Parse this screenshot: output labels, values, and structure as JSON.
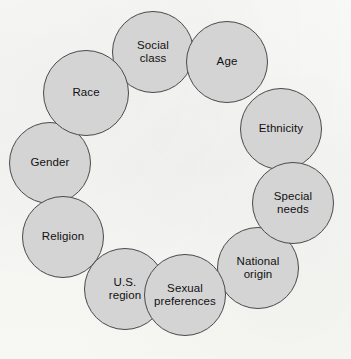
{
  "diagram": {
    "type": "circular-cluster",
    "title": "",
    "geometry": {
      "canvas_width": 351,
      "canvas_height": 359,
      "ring_center_x": 171,
      "ring_center_y": 172,
      "ring_radius": 118,
      "node_diameter": 80
    },
    "style": {
      "node_fill": "#d4d4d4",
      "node_stroke": "#4a4a4a",
      "background": "#f7f7f5",
      "text_color": "#111111"
    },
    "nodes": [
      {
        "id": "social-class",
        "label": "Social\nclass",
        "x": 112,
        "y": 11,
        "size": 82,
        "z": 6
      },
      {
        "id": "age",
        "label": "Age",
        "x": 186,
        "y": 21,
        "size": 82,
        "z": 7
      },
      {
        "id": "ethnicity",
        "label": "Ethnicity",
        "x": 240,
        "y": 88,
        "size": 82,
        "z": 5
      },
      {
        "id": "special-needs",
        "label": "Special\nneeds",
        "x": 252,
        "y": 162,
        "size": 82,
        "z": 8
      },
      {
        "id": "national-origin",
        "label": "National\norigin",
        "x": 217,
        "y": 227,
        "size": 82,
        "z": 4
      },
      {
        "id": "sexual-preferences",
        "label": "Sexual\npreferences",
        "x": 144,
        "y": 254,
        "size": 82,
        "z": 9
      },
      {
        "id": "us-region",
        "label": "U.S.\nregion",
        "x": 84,
        "y": 248,
        "size": 82,
        "z": 3
      },
      {
        "id": "religion",
        "label": "Religion",
        "x": 22,
        "y": 196,
        "size": 82,
        "z": 7
      },
      {
        "id": "gender",
        "label": "Gender",
        "x": 9,
        "y": 122,
        "size": 82,
        "z": 2
      },
      {
        "id": "race",
        "label": "Race",
        "x": 43,
        "y": 50,
        "size": 86,
        "z": 6
      }
    ]
  }
}
